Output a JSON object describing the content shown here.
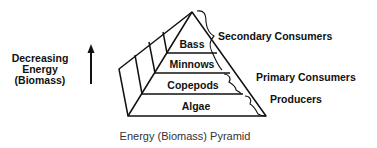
{
  "diagram": {
    "caption": "Energy (Biomass) Pyramid",
    "axis_label": {
      "line1": "Decreasing",
      "line2": "Energy",
      "line3": "(Biomass)"
    },
    "tiers": [
      {
        "label": "Bass"
      },
      {
        "label": "Minnows"
      },
      {
        "label": "Copepods"
      },
      {
        "label": "Algae"
      }
    ],
    "groups": [
      {
        "label": "Secondary Consumers"
      },
      {
        "label": "Primary Consumers"
      },
      {
        "label": "Producers"
      }
    ],
    "colors": {
      "stroke": "#111111",
      "background": "#ffffff"
    }
  }
}
